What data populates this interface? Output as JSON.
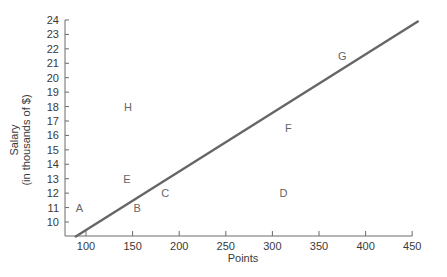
{
  "chart_data": {
    "type": "scatter",
    "title": "",
    "xlabel": "Points",
    "ylabel": [
      "Salary",
      "(in thousands of $)"
    ],
    "xlim": [
      80,
      460
    ],
    "ylim": [
      9,
      24
    ],
    "x_ticks": [
      100,
      150,
      200,
      250,
      300,
      350,
      400,
      450
    ],
    "y_ticks": [
      10,
      11,
      12,
      13,
      14,
      15,
      16,
      17,
      18,
      19,
      20,
      21,
      22,
      23,
      24
    ],
    "grid": false,
    "legend": null,
    "points": [
      {
        "label": "A",
        "x": 93,
        "y": 11
      },
      {
        "label": "B",
        "x": 155,
        "y": 11
      },
      {
        "label": "C",
        "x": 185,
        "y": 12
      },
      {
        "label": "D",
        "x": 312,
        "y": 12
      },
      {
        "label": "E",
        "x": 144,
        "y": 13
      },
      {
        "label": "F",
        "x": 317,
        "y": 16.5
      },
      {
        "label": "G",
        "x": 375,
        "y": 21.5
      },
      {
        "label": "H",
        "x": 145,
        "y": 18
      }
    ],
    "line": {
      "name": "wage curve",
      "x": [
        89,
        456
      ],
      "y": [
        9,
        23.9
      ],
      "color": "#666666"
    }
  },
  "colors": {
    "axis": "#6a6a6a",
    "line": "#666666",
    "text": "#3a3a3a"
  }
}
